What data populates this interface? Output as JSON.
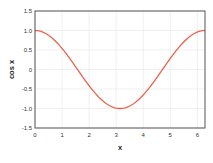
{
  "chart_data": {
    "type": "line",
    "title": "",
    "xlabel": "x",
    "ylabel": "cos x",
    "xlim": [
      0,
      6.283
    ],
    "ylim": [
      -1.5,
      1.5
    ],
    "grid": true,
    "legend": null,
    "x_ticks": [
      "0",
      "1",
      "2",
      "3",
      "4",
      "5",
      "6"
    ],
    "y_ticks": [
      "1.5",
      "1.0",
      "0.5",
      "0",
      "-0.5",
      "-1.0",
      "-1.5"
    ],
    "series": [
      {
        "name": "cos x",
        "color": "#e8644a",
        "function": "cos(x)",
        "x": [
          0,
          0.785,
          1.571,
          2.356,
          3.142,
          3.927,
          4.712,
          5.498,
          6.283
        ],
        "values": [
          1.0,
          0.707,
          0.0,
          -0.707,
          -1.0,
          -0.707,
          0.0,
          0.707,
          1.0
        ]
      }
    ]
  },
  "colors": {
    "frame": "#555555",
    "grid": "#e6e6e6",
    "line": "#e8644a"
  }
}
